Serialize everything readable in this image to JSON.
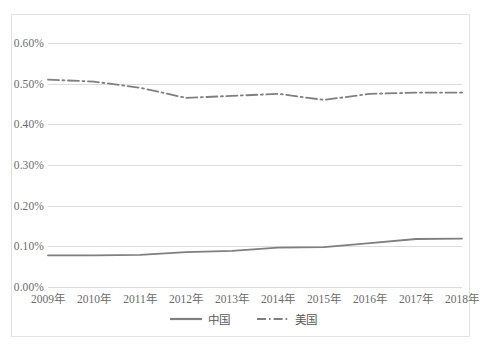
{
  "chart_data": {
    "type": "line",
    "title": "",
    "xlabel": "",
    "ylabel": "",
    "categories": [
      "2009年",
      "2010年",
      "2011年",
      "2012年",
      "2013年",
      "2014年",
      "2015年",
      "2016年",
      "2017年",
      "2018年"
    ],
    "ylim": [
      0.0,
      0.6
    ],
    "ytick_labels": [
      "0.00%",
      "0.10%",
      "0.20%",
      "0.30%",
      "0.40%",
      "0.50%",
      "0.60%"
    ],
    "ytick_values": [
      0.0,
      0.1,
      0.2,
      0.3,
      0.4,
      0.5,
      0.6
    ],
    "unit": "%",
    "grid": true,
    "legend_position": "bottom",
    "series": [
      {
        "name": "中国",
        "style": "solid",
        "color": "#7f7f7f",
        "values": [
          0.078,
          0.078,
          0.079,
          0.086,
          0.089,
          0.097,
          0.098,
          0.108,
          0.118,
          0.119
        ]
      },
      {
        "name": "美国",
        "style": "dash-dot",
        "color": "#7f7f7f",
        "values": [
          0.51,
          0.505,
          0.49,
          0.465,
          0.47,
          0.475,
          0.46,
          0.475,
          0.478,
          0.478
        ]
      }
    ]
  },
  "legend": {
    "items": [
      {
        "label": "中国"
      },
      {
        "label": "美国"
      }
    ]
  }
}
